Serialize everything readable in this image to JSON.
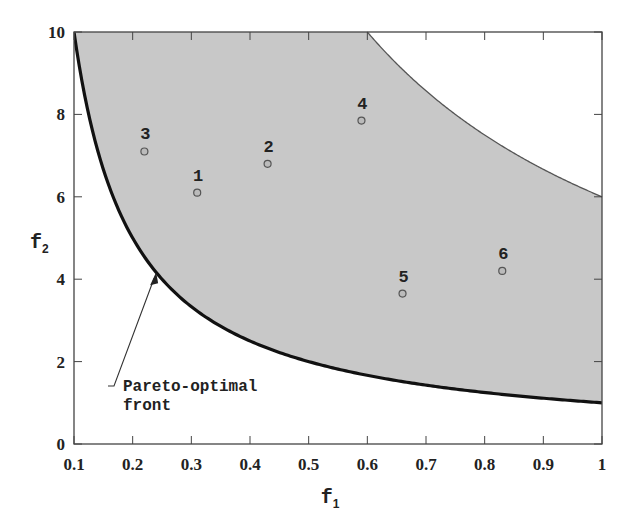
{
  "chart_data": {
    "type": "scatter",
    "title": "",
    "xlabel": "f1",
    "ylabel": "f2",
    "xlim": [
      0.1,
      1
    ],
    "ylim": [
      0,
      10
    ],
    "grid": false,
    "x_ticks": [
      "0.1",
      "0.2",
      "0.3",
      "0.4",
      "0.5",
      "0.6",
      "0.7",
      "0.8",
      "0.9",
      "1"
    ],
    "y_ticks": [
      "0",
      "2",
      "4",
      "6",
      "8",
      "10"
    ],
    "feasible_region": {
      "fill_color": "#c8c8c8",
      "lower_boundary": "f2 = 1/f1 (Pareto-optimal front)",
      "upper_boundary": "f2 = 6/f1"
    },
    "series": [
      {
        "name": "solutions",
        "points": [
          {
            "label": "1",
            "x": 0.31,
            "y": 6.1
          },
          {
            "label": "2",
            "x": 0.43,
            "y": 6.8
          },
          {
            "label": "3",
            "x": 0.22,
            "y": 7.1
          },
          {
            "label": "4",
            "x": 0.59,
            "y": 7.85
          },
          {
            "label": "5",
            "x": 0.66,
            "y": 3.65
          },
          {
            "label": "6",
            "x": 0.83,
            "y": 4.2
          }
        ]
      }
    ],
    "annotations": [
      {
        "text_line1": "Pareto-optimal",
        "text_line2": "front",
        "arrow_to": {
          "x": 0.24,
          "y": 4.17
        }
      }
    ]
  }
}
